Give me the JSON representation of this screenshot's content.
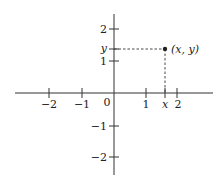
{
  "diagram": {
    "type": "cartesian-coordinate-plane",
    "origin_label": "0",
    "x_axis": {
      "ticks": [
        {
          "value": -2,
          "label": "−2"
        },
        {
          "value": -1,
          "label": "−1"
        },
        {
          "value": 1,
          "label": "1"
        },
        {
          "value": "x",
          "label": "x"
        },
        {
          "value": 2,
          "label": "2"
        }
      ]
    },
    "y_axis": {
      "ticks": [
        {
          "value": 2,
          "label": "2"
        },
        {
          "value": "y",
          "label": "y"
        },
        {
          "value": 1,
          "label": "1"
        },
        {
          "value": -1,
          "label": "−1"
        },
        {
          "value": -2,
          "label": "−2"
        }
      ]
    },
    "point": {
      "label": "(x, y)",
      "x": 1.6,
      "y": 1.4
    },
    "guides": "dashed lines from point to both axes"
  }
}
